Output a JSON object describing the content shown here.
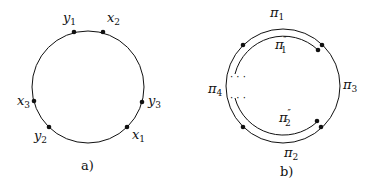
{
  "panel_a": {
    "caption": "a)",
    "labels": {
      "y1": {
        "base": "y",
        "sub": "1"
      },
      "x2": {
        "base": "x",
        "sub": "2"
      },
      "y3": {
        "base": "y",
        "sub": "3"
      },
      "x1": {
        "base": "x",
        "sub": "1"
      },
      "y2": {
        "base": "y",
        "sub": "2"
      },
      "x3": {
        "base": "x",
        "sub": "3"
      }
    }
  },
  "panel_b": {
    "caption": "b)",
    "labels": {
      "pi1": {
        "base": "π",
        "sub": "1"
      },
      "pi1pp": {
        "base": "π",
        "sup": "″",
        "sub": "1"
      },
      "pi2": {
        "base": "π",
        "sub": "2"
      },
      "pi2pp": {
        "base": "π",
        "sup": "″",
        "sub": "2"
      },
      "pi3": {
        "base": "π",
        "sub": "3"
      },
      "pi4": {
        "base": "π",
        "sub": "4"
      }
    },
    "ellipsis": "· · ·"
  }
}
